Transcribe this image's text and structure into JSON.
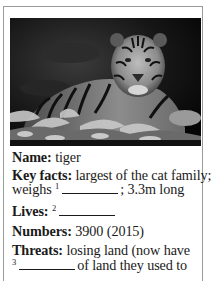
{
  "image": {
    "subject": "tiger",
    "description": "black-and-white photo of a tiger lying behind foliage",
    "icon": "tiger-photo"
  },
  "facts": {
    "name": {
      "label": "Name:",
      "value": "tiger"
    },
    "key_facts": {
      "label": "Key facts:",
      "line1": "largest of the cat family;",
      "line2_prefix": "weighs",
      "blank_number": "1",
      "line2_suffix": "; 3.3m long"
    },
    "lives": {
      "label": "Lives:",
      "blank_number": "2"
    },
    "numbers": {
      "label": "Numbers:",
      "value": "3900 (2015)"
    },
    "threats": {
      "label": "Threats:",
      "line1": "losing land (now have",
      "blank_number": "3",
      "line2_suffix": "of land they used to"
    }
  },
  "colors": {
    "border": "#9a9a9a",
    "text": "#1a1a1a",
    "background": "#ffffff"
  }
}
